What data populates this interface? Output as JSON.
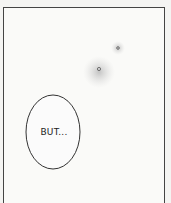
{
  "comic_panel": {
    "speech_bubble": {
      "text": "BUT..."
    },
    "colors": {
      "border": "#444444",
      "background": "#fafaf8",
      "tone": "#c8c8c8"
    }
  }
}
